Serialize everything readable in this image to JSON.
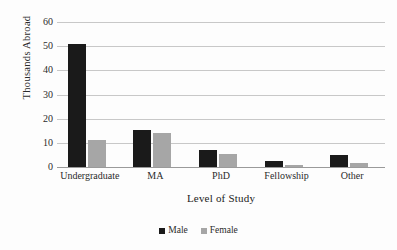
{
  "figure": {
    "background": "#fdfdfd",
    "scan_artifact_text": "……………………………………………………"
  },
  "colors": {
    "male": "#1a1a1a",
    "female": "#a6a6a6",
    "gridline": "#c8c8c8",
    "axis": "#9a9a9a",
    "text": "#2b2b2b"
  },
  "legend": {
    "position": "bottom-center",
    "items": [
      {
        "label": "Male",
        "color_key": "male"
      },
      {
        "label": "Female",
        "color_key": "female"
      }
    ]
  },
  "chart_data": {
    "type": "bar",
    "title": "",
    "xlabel": "Level of Study",
    "ylabel": "Thousands Abroad",
    "categories": [
      "Undergraduate",
      "MA",
      "PhD",
      "Fellowship",
      "Other"
    ],
    "series": [
      {
        "name": "Male",
        "values": [
          51,
          15.5,
          7,
          2.5,
          5
        ]
      },
      {
        "name": "Female",
        "values": [
          11,
          14,
          5.5,
          1,
          1.5
        ]
      }
    ],
    "ylim": [
      0,
      60
    ],
    "yticks": [
      0,
      10,
      20,
      30,
      40,
      50,
      60
    ],
    "ytick_labels": [
      "0",
      "10",
      "20",
      "30",
      "40",
      "50",
      "60"
    ],
    "grid": true,
    "grid_axis": "y",
    "legend_position": "bottom-center",
    "bar_orientation": "vertical",
    "grouped": true
  }
}
